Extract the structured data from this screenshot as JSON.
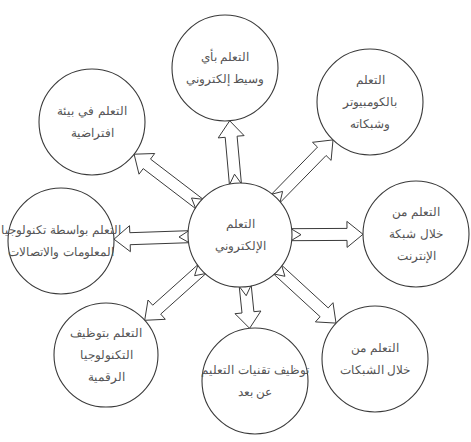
{
  "diagram": {
    "type": "radial-concept-map",
    "center": {
      "id": "e-learning",
      "cx": 240,
      "cy": 235,
      "r": 52,
      "lines": [
        "التعلم",
        "الإلكتروني"
      ]
    },
    "nodes": [
      {
        "id": "any-electronic-medium",
        "cx": 225,
        "cy": 68,
        "r": 53,
        "lines": [
          "التعلم بأي",
          "وسيط إلكتروني"
        ]
      },
      {
        "id": "computer-and-networks",
        "cx": 370,
        "cy": 102,
        "r": 53,
        "lines": [
          "التعلم",
          "بالكومبيوتر",
          "وشبكاته"
        ]
      },
      {
        "id": "internet",
        "cx": 416,
        "cy": 234,
        "r": 53,
        "lines": [
          "التعلم من",
          "خلال شبكة",
          "الإنترنت"
        ]
      },
      {
        "id": "networks",
        "cx": 375,
        "cy": 359,
        "r": 53,
        "lines": [
          "التعلم من",
          "خلال الشبكات"
        ]
      },
      {
        "id": "distance-education-tech",
        "cx": 255,
        "cy": 381,
        "r": 53,
        "lines": [
          "توظيف تقنيات التعليم",
          "عن بعد"
        ]
      },
      {
        "id": "digital-technology",
        "cx": 106,
        "cy": 355,
        "r": 52,
        "lines": [
          "التعلم بتوظيف",
          "التكنولوجيا",
          "الرقمية"
        ]
      },
      {
        "id": "ict",
        "cx": 61,
        "cy": 241,
        "r": 53,
        "lines": [
          "التعلم بواسطة تكنولوجيا",
          "المعلومات والاتصالات"
        ]
      },
      {
        "id": "virtual-environment",
        "cx": 92,
        "cy": 122,
        "r": 53,
        "lines": [
          "التعلم في بيئة",
          "افتراضية"
        ]
      }
    ],
    "colors": {
      "stroke": "#3a3a3a",
      "text": "#555555",
      "background": "#ffffff"
    }
  }
}
